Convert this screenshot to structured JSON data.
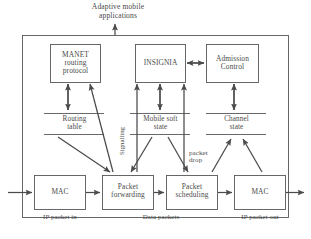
{
  "diagram": {
    "title": "Adaptive mobile\napplications",
    "outer_frame": {
      "name": "system-boundary"
    },
    "modules": [
      {
        "id": "manet",
        "label": "MANET\nrouting\nprotocol"
      },
      {
        "id": "insignia",
        "label": "INSIGNIA"
      },
      {
        "id": "admission",
        "label": "Admission\nControl"
      }
    ],
    "states": [
      {
        "id": "routing-table",
        "label": "Routing\ntable"
      },
      {
        "id": "mobile-soft-state",
        "label": "Mobile soft\nstate"
      },
      {
        "id": "channel-state",
        "label": "Channel\nstate"
      }
    ],
    "pipeline": [
      {
        "id": "mac-in",
        "label": "MAC",
        "caption": "IP packet in"
      },
      {
        "id": "packet-forwarding",
        "label": "Packet\nforwarding",
        "caption": "Data packets"
      },
      {
        "id": "packet-scheduling",
        "label": "Packet\nscheduling",
        "caption": ""
      },
      {
        "id": "mac-out",
        "label": "MAC",
        "caption": "IP packet out"
      }
    ],
    "annotations": [
      {
        "id": "signalling",
        "label": "Signalling"
      },
      {
        "id": "packet-drop",
        "label": "packet\ndrop"
      }
    ],
    "colors": {
      "stroke": "#58585a",
      "text": "#4a4a4a",
      "background": "#ffffff"
    }
  }
}
